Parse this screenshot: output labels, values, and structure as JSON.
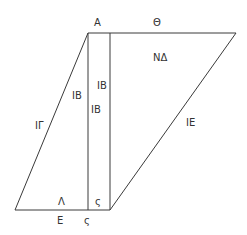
{
  "diagram": {
    "type": "geometric-figure",
    "colors": {
      "line": "#3a3a3a",
      "text": "#333333",
      "background": "#ffffff"
    },
    "labels": {
      "top_vertex": "A",
      "top_edge": "Θ",
      "right_region": "NΔ",
      "strip_upper": "IB",
      "left_region": "IB",
      "strip_lower": "IB",
      "left_edge": "IΓ",
      "right_edge": "IE",
      "bottom_inner_left": "Λ",
      "bottom_inner_strip": "ς",
      "bottom_outer_left": "E",
      "bottom_outer_strip": "ς"
    }
  }
}
